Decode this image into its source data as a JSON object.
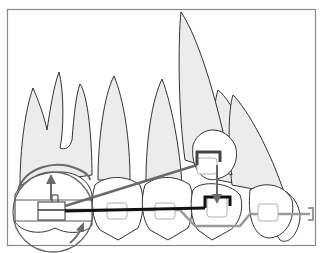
{
  "figure": {
    "type": "orthodontic-diagram",
    "colors": {
      "frame": "#8a8a8a",
      "tooth_fill": "#ececec",
      "crown_fill": "#ffffff",
      "outline": "#333333",
      "archwire": "#9a9a9a",
      "cantilever": "#111111",
      "arrow": "#6a6a6a",
      "bracket": "#b0b0b0"
    },
    "elements": {
      "teeth": [
        "first-molar",
        "second-premolar",
        "first-premolar",
        "canine",
        "lateral-incisor",
        "central-incisor"
      ],
      "molar_tube_label": "",
      "arrows": [
        "molar-up-arrow",
        "molar-rotation-arc",
        "canine-down-arrow"
      ]
    }
  }
}
